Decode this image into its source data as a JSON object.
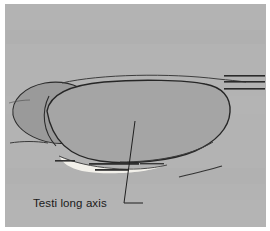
{
  "figure": {
    "kind": "ultrasound-line-drawing",
    "panel_background_color": "#b3b3b3",
    "outer_background_color": "#ffffff",
    "organ_fill_color": "#a5a5a5",
    "epididymis_fill_color": "#9a9a9a",
    "outline_color": "#262626",
    "highlight_color": "#f2f0ea",
    "annotations": [
      {
        "id": "testi-long-axis",
        "label": "Testi long axis",
        "leader": "from label right edge up to the mid-body of the testis",
        "text_color": "#1a1a1a"
      }
    ],
    "depth_markers": {
      "count": 3,
      "position": "right edge",
      "color": "#2b2b2b"
    }
  }
}
